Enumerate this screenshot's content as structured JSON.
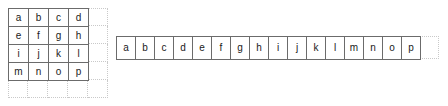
{
  "diagram": {
    "colors": {
      "solid_border": "#6b6b6b",
      "ghost_border": "#c9c9c9",
      "text": "#1a1a1a",
      "background": "#ffffff"
    },
    "matrix": {
      "name": "4x4-matrix",
      "rows": 4,
      "columns": 4,
      "ghost_rows": 5,
      "ghost_columns": 5,
      "cell_width": 20,
      "cell_height": 18,
      "values": [
        [
          "a",
          "b",
          "c",
          "d"
        ],
        [
          "e",
          "f",
          "g",
          "h"
        ],
        [
          "i",
          "j",
          "k",
          "l"
        ],
        [
          "m",
          "n",
          "o",
          "p"
        ]
      ]
    },
    "vector": {
      "name": "flattened-row-vector",
      "rows": 1,
      "columns": 16,
      "ghost_columns": 17,
      "cell_width": 19,
      "cell_height": 23,
      "values": [
        "a",
        "b",
        "c",
        "d",
        "e",
        "f",
        "g",
        "h",
        "i",
        "j",
        "k",
        "l",
        "m",
        "n",
        "o",
        "p"
      ]
    }
  }
}
